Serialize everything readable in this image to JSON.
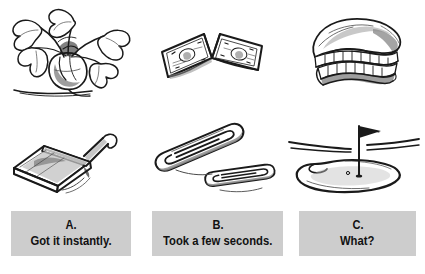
{
  "page": {
    "background_color": "#ffffff",
    "ink_color": "#1a1a1a",
    "box_color": "#cdcdcd",
    "text_color": "#111111"
  },
  "sketches": {
    "rows": 2,
    "columns": 3,
    "items": [
      {
        "id": "beet-plant",
        "label": "beet plant with leafy greens",
        "row": 0,
        "column": 0
      },
      {
        "id": "dollar-bills",
        "label": "two folded dollar bills",
        "row": 0,
        "column": 1
      },
      {
        "id": "dentures",
        "label": "set of false teeth",
        "row": 0,
        "column": 2
      },
      {
        "id": "dustpan",
        "label": "dustpan with handle",
        "row": 1,
        "column": 0
      },
      {
        "id": "paper-clips",
        "label": "two paper clips",
        "row": 1,
        "column": 1
      },
      {
        "id": "golf-green",
        "label": "golf green with flag in hole",
        "row": 1,
        "column": 2
      }
    ]
  },
  "options": [
    {
      "letter": "A.",
      "text": "Got it instantly."
    },
    {
      "letter": "B.",
      "text": "Took a few seconds."
    },
    {
      "letter": "C.",
      "text": "What?"
    }
  ]
}
